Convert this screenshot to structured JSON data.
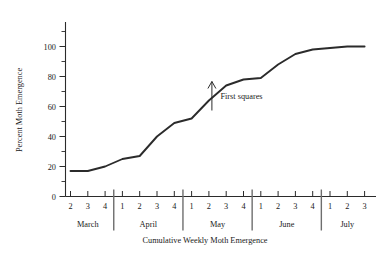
{
  "chart_data": {
    "type": "line",
    "title": "",
    "xlabel": "Cumulative Weekly Moth Emergence",
    "ylabel": "Percent Moth Emergence",
    "ylim": [
      0,
      105
    ],
    "yticks": [
      0,
      20,
      40,
      60,
      80,
      100
    ],
    "ytick_labels": [
      "0",
      "20",
      "40",
      "60",
      "80",
      "100"
    ],
    "minor_yticks": [
      10,
      30,
      50,
      70,
      90
    ],
    "grid": false,
    "legend": "none",
    "x_tick_labels": [
      "2",
      "3",
      "4",
      "1",
      "2",
      "3",
      "4",
      "1",
      "2",
      "3",
      "4",
      "1",
      "2",
      "3",
      "4",
      "1",
      "2",
      "3"
    ],
    "month_groups": [
      {
        "label": "March",
        "weeks": [
          "2",
          "3",
          "4"
        ]
      },
      {
        "label": "April",
        "weeks": [
          "1",
          "2",
          "3",
          "4"
        ]
      },
      {
        "label": "May",
        "weeks": [
          "1",
          "2",
          "3",
          "4"
        ]
      },
      {
        "label": "June",
        "weeks": [
          "1",
          "2",
          "3",
          "4"
        ]
      },
      {
        "label": "July",
        "weeks": [
          "1",
          "2",
          "3"
        ]
      }
    ],
    "series": [
      {
        "name": "Percent Moth Emergence",
        "x": [
          "March 2",
          "March 3",
          "March 4",
          "April 1",
          "April 2",
          "April 3",
          "April 4",
          "May 1",
          "May 2",
          "May 3",
          "May 4",
          "June 1",
          "June 2",
          "June 3",
          "June 4",
          "July 1",
          "July 2",
          "July 3"
        ],
        "values": [
          17,
          17,
          20,
          25,
          27,
          40,
          49,
          52,
          64,
          74,
          78,
          79,
          88,
          95,
          98,
          99,
          100,
          100
        ]
      }
    ],
    "annotations": [
      {
        "text": "First squares",
        "points_to_x": "May 2",
        "points_to_y": 78,
        "arrow": "up"
      }
    ]
  }
}
